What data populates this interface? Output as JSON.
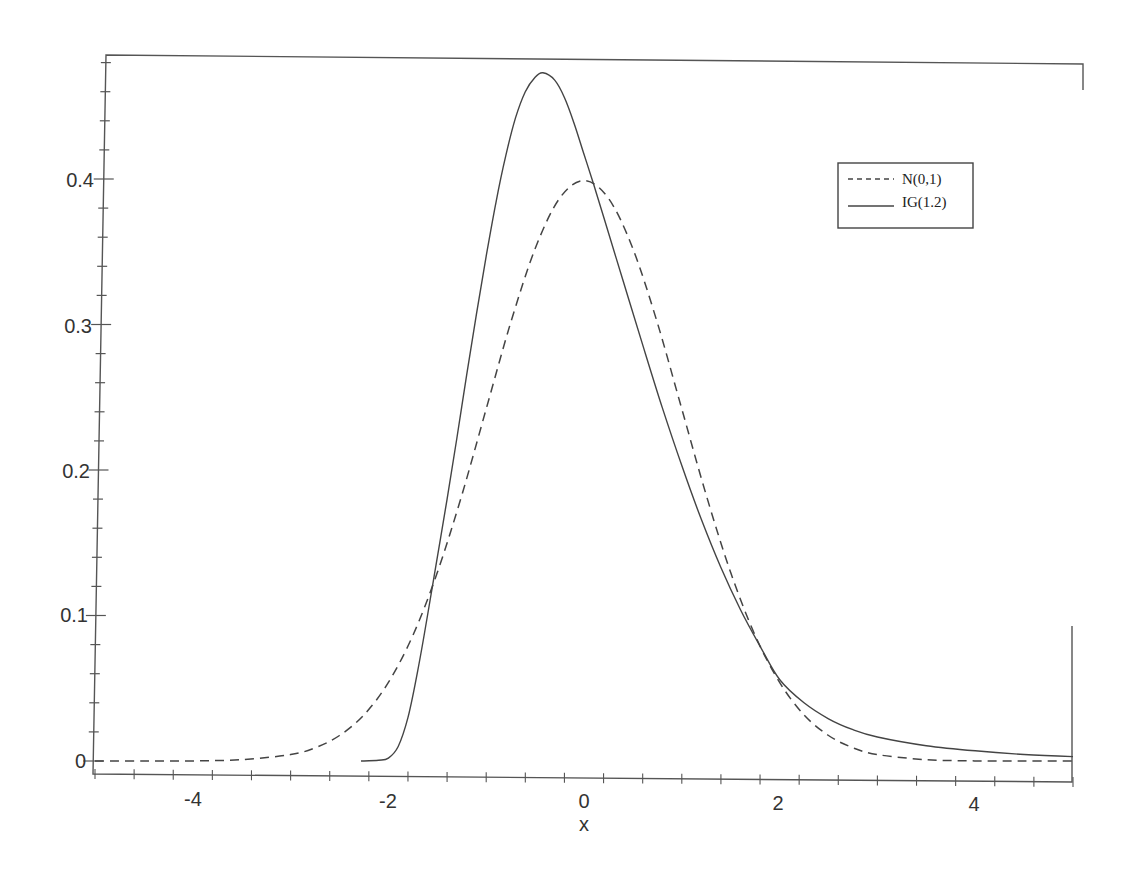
{
  "chart_data": {
    "type": "line",
    "title": "",
    "xlabel": "x",
    "ylabel": "",
    "xlim": [
      -5,
      5
    ],
    "ylim": [
      -0.009,
      0.487
    ],
    "grid": false,
    "legend_position": "upper-right",
    "x_ticks": [
      -4,
      -2,
      0,
      2,
      4
    ],
    "x_tick_labels": [
      "-4",
      "-2",
      "0",
      "2",
      "4"
    ],
    "x_minor_step": 0.4,
    "y_ticks": [
      0,
      0.1,
      0.2,
      0.3,
      0.4
    ],
    "y_tick_labels": [
      "0",
      "0.1",
      "0.2",
      "0.3",
      "0.4"
    ],
    "y_minor_step": 0.02,
    "series": [
      {
        "name": "N(0,1)",
        "style": "dashed",
        "x": [
          -5,
          -4.5,
          -4,
          -3.5,
          -3,
          -2.75,
          -2.5,
          -2.25,
          -2,
          -1.75,
          -1.5,
          -1.25,
          -1,
          -0.75,
          -0.5,
          -0.25,
          0,
          0.25,
          0.5,
          0.75,
          1,
          1.25,
          1.5,
          1.75,
          2,
          2.25,
          2.5,
          2.75,
          3,
          3.5,
          4,
          4.5,
          5
        ],
        "values": [
          0.0,
          0.0,
          0.0001,
          0.0009,
          0.0044,
          0.0091,
          0.0175,
          0.0317,
          0.054,
          0.0863,
          0.1295,
          0.1826,
          0.242,
          0.3011,
          0.3521,
          0.3867,
          0.3989,
          0.3867,
          0.3521,
          0.3011,
          0.242,
          0.1826,
          0.1295,
          0.0863,
          0.054,
          0.0317,
          0.0175,
          0.0091,
          0.0044,
          0.0009,
          0.0001,
          0.0,
          0.0
        ]
      },
      {
        "name": "IG(1.2)",
        "style": "solid",
        "x": [
          -2.28,
          -2.1,
          -2.0,
          -1.9,
          -1.8,
          -1.7,
          -1.6,
          -1.5,
          -1.4,
          -1.3,
          -1.2,
          -1.1,
          -1.0,
          -0.9,
          -0.8,
          -0.7,
          -0.6,
          -0.5,
          -0.42,
          -0.3,
          -0.2,
          -0.1,
          0,
          0.1,
          0.2,
          0.4,
          0.6,
          0.8,
          1.0,
          1.2,
          1.4,
          1.6,
          1.8,
          2.0,
          2.25,
          2.5,
          2.75,
          3.0,
          3.5,
          4.0,
          4.5,
          5.0
        ],
        "values": [
          0.0,
          0.0005,
          0.002,
          0.01,
          0.03,
          0.062,
          0.1,
          0.14,
          0.18,
          0.222,
          0.265,
          0.307,
          0.347,
          0.384,
          0.416,
          0.442,
          0.46,
          0.47,
          0.473,
          0.468,
          0.456,
          0.438,
          0.417,
          0.396,
          0.374,
          0.33,
          0.286,
          0.243,
          0.203,
          0.166,
          0.133,
          0.104,
          0.079,
          0.056,
          0.04,
          0.029,
          0.0215,
          0.0165,
          0.0105,
          0.007,
          0.0045,
          0.003
        ]
      }
    ],
    "legend": [
      {
        "label": "N(0,1)",
        "style": "dashed"
      },
      {
        "label": "IG(1.2)",
        "style": "solid"
      }
    ],
    "colors": {
      "line": "#444444",
      "axis": "#555555",
      "text": "#333333"
    }
  },
  "axes": {
    "xlabel": "x",
    "y_labels": [
      "0",
      "0.1",
      "0.2",
      "0.3",
      "0.4"
    ],
    "x_labels": [
      "-4",
      "-2",
      "0",
      "2",
      "4"
    ]
  },
  "legend": {
    "items": [
      "N(0,1)",
      "IG(1.2)"
    ]
  }
}
